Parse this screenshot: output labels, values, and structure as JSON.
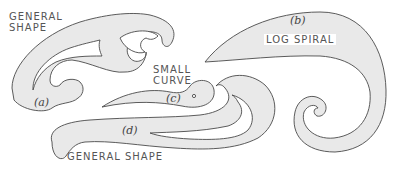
{
  "figure": {
    "labels": {
      "a_letter": "(a)",
      "a_name": "GENERAL\nSHAPE",
      "b_letter": "(b)",
      "b_name": "LOG SPIRAL",
      "c_letter": "(c)",
      "c_name": "SMALL\nCURVE",
      "d_letter": "(d)",
      "d_name": "GENERAL SHAPE"
    },
    "colors": {
      "fill": "#e9e9e9",
      "stroke": "#4a4a4a",
      "background": "#ffffff"
    }
  }
}
